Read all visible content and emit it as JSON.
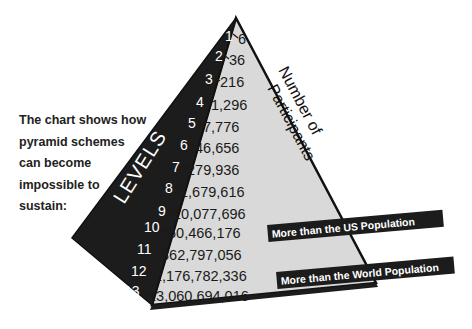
{
  "caption": {
    "lines": [
      "The chart shows how",
      "pyramid schemes",
      "can become",
      "impossible to",
      "sustain:"
    ]
  },
  "pyramid": {
    "left_face_label": "LEVELS",
    "right_face_label_line1": "Number of",
    "right_face_label_line2": "Participants",
    "colors": {
      "dark_face": "#1c1c1c",
      "light_face": "#d9d9d9",
      "outline": "#111111",
      "banner": "#1c1c1c"
    }
  },
  "levels": [
    {
      "level": "1",
      "participants": "6"
    },
    {
      "level": "2",
      "participants": "36"
    },
    {
      "level": "3",
      "participants": "216"
    },
    {
      "level": "4",
      "participants": "1,296"
    },
    {
      "level": "5",
      "participants": "7,776"
    },
    {
      "level": "6",
      "participants": "46,656"
    },
    {
      "level": "7",
      "participants": "279,936"
    },
    {
      "level": "8",
      "participants": "1,679,616"
    },
    {
      "level": "9",
      "participants": "10,077,696"
    },
    {
      "level": "10",
      "participants": "60,466,176"
    },
    {
      "level": "11",
      "participants": "362,797,056"
    },
    {
      "level": "12",
      "participants": "2,176,782,336"
    },
    {
      "level": "13",
      "participants": "13,060,694,016"
    }
  ],
  "annotations": {
    "us": "More than the US Population",
    "world": "More than the World Population"
  }
}
